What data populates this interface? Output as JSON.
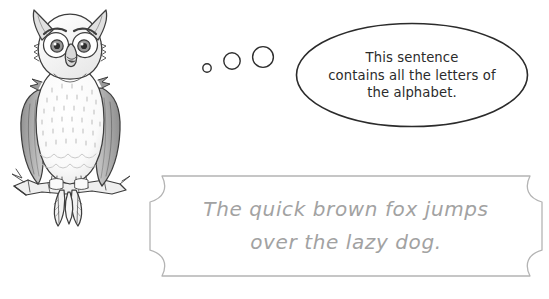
{
  "page": {
    "background_color": "#ffffff",
    "width": 549,
    "height": 299
  },
  "owl": {
    "name": "owl-illustration",
    "description": "Cartoon grey and white owl perched on a branch",
    "colors": {
      "outline": "#3d3d3d",
      "wing_gray": "#9b9b9b",
      "wing_gray_dark": "#7d7d7d",
      "body_light": "#fbfbfb",
      "body_shade": "#e2e2e2",
      "eye_iris": "#9a9a9a",
      "beak": "#d7d7d7",
      "branch": "#ededed"
    }
  },
  "thought_dots": {
    "name": "thought-trail",
    "color": "#3d3d3d",
    "circles": [
      {
        "cx": 11,
        "cy": 28,
        "r": 4.2
      },
      {
        "cx": 36,
        "cy": 21,
        "r": 8.2
      },
      {
        "cx": 67,
        "cy": 17,
        "r": 10.4
      }
    ]
  },
  "bubble": {
    "name": "speech-bubble",
    "outline_color": "#2b2b2b",
    "fill_color": "#ffffff",
    "text_color": "#2b2b2b",
    "text": "This sentence\ncontains all the letters of\nthe alphabet.",
    "lines": [
      "This sentence",
      "contains all the letters of",
      "the alphabet."
    ]
  },
  "banner": {
    "name": "pangram-banner",
    "outline_color": "#b4b4b4",
    "fill_color": "#ffffff",
    "text_color": "#a2a2a2",
    "text": "The quick brown fox jumps\nover the lazy dog.",
    "lines": [
      "The quick brown fox jumps",
      "over the lazy dog."
    ]
  }
}
